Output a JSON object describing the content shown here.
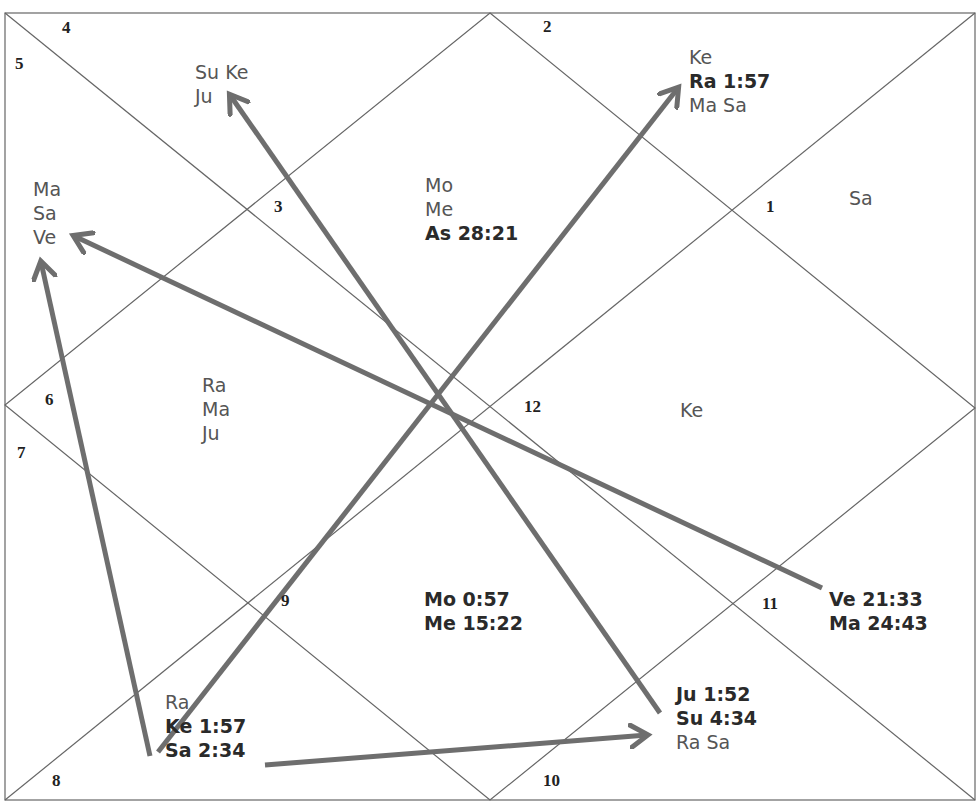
{
  "chart": {
    "style": "North Indian astrology chart with transit arrows",
    "line_color": "#666666",
    "arrow_color": "#6e6e6e",
    "houses": [
      {
        "number": "1",
        "planets": [
          "Sa"
        ]
      },
      {
        "number": "2",
        "planets": [
          "Ke",
          "Ra 1:57",
          "Ma Sa"
        ]
      },
      {
        "number": "3",
        "planets": [
          "Su Ke",
          "Ju"
        ]
      },
      {
        "number": "4",
        "planets": []
      },
      {
        "number": "5",
        "planets": [
          "Ma",
          "Sa",
          "Ve"
        ]
      },
      {
        "number": "6",
        "planets": [
          "Ra",
          "Ma",
          "Ju"
        ]
      },
      {
        "number": "7",
        "planets": []
      },
      {
        "number": "8",
        "planets": [
          "Ra",
          "Ke 1:57",
          "Sa 2:34"
        ]
      },
      {
        "number": "9",
        "planets": [
          "Mo 0:57",
          "Me 15:22"
        ]
      },
      {
        "number": "10",
        "planets": [
          "Ju 1:52",
          "Su 4:34",
          "Ra Sa"
        ]
      },
      {
        "number": "11",
        "planets": [
          "Ve 21:33",
          "Ma 24:43"
        ]
      },
      {
        "number": "12",
        "planets": [
          "Ke"
        ]
      }
    ],
    "center": {
      "planets": [
        "Mo",
        "Me",
        "As 28:21"
      ]
    },
    "labels": {
      "h1": "1",
      "h2": "2",
      "h3": "3",
      "h4": "4",
      "h5": "5",
      "h6": "6",
      "h7": "7",
      "h8": "8",
      "h9": "9",
      "h10": "10",
      "h11": "11",
      "h12": "12",
      "top_left_1": "Su Ke",
      "top_left_2": "Ju",
      "left_1": "Ma",
      "left_2": "Sa",
      "left_3": "Ve",
      "center_1": "Mo",
      "center_2": "Me",
      "center_3": "As 28:21",
      "top_right_1": "Ke",
      "top_right_2": "Ra 1:57",
      "top_right_3": "Ma Sa",
      "right_top": "Sa",
      "left_mid_1": "Ra",
      "left_mid_2": "Ma",
      "left_mid_3": "Ju",
      "right_mid": "Ke",
      "bottom_center_1": "Mo 0:57",
      "bottom_center_2": "Me 15:22",
      "right_low_1": "Ve 21:33",
      "right_low_2": "Ma 24:43",
      "bottom_left_1": "Ra",
      "bottom_left_2": "Ke 1:57",
      "bottom_left_3": "Sa 2:34",
      "bottom_right_1": "Ju 1:52",
      "bottom_right_2": "Su 4:34",
      "bottom_right_3": "Ra Sa"
    },
    "arrows": [
      {
        "from": "Sa 2:34",
        "to": "Ve (house 5)"
      },
      {
        "from": "Ke 1:57",
        "to": "Ra 1:57"
      },
      {
        "from": "Ju 1:52",
        "to": "Ju (house 3)"
      },
      {
        "from": "Ve 21:33",
        "to": "Ve (house 5)"
      },
      {
        "from": "Sa 2:34",
        "to": "Su 4:34"
      }
    ]
  }
}
